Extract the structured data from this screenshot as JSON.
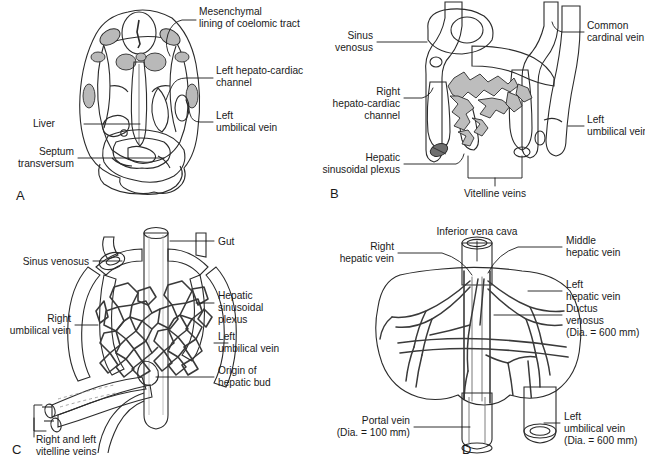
{
  "figure": {
    "panels": [
      {
        "letter": "A",
        "name": "panel-a",
        "labels": [
          {
            "id": "mesenchymal",
            "line1": "Mesenchymal",
            "line2": "lining of coelomic tract"
          },
          {
            "id": "left-hepato-cardiac",
            "line1": "Left hepato-cardiac",
            "line2": "channel"
          },
          {
            "id": "left-umbilical-vein",
            "line1": "Left",
            "line2": "umbilical vein"
          },
          {
            "id": "liver",
            "line1": "Liver",
            "line2": ""
          },
          {
            "id": "septum-transversum",
            "line1": "Septum",
            "line2": "transversum"
          }
        ]
      },
      {
        "letter": "B",
        "name": "panel-b",
        "labels": [
          {
            "id": "sinus-venosus",
            "line1": "Sinus",
            "line2": "venosus"
          },
          {
            "id": "common-cardinal-vein",
            "line1": "Common",
            "line2": "cardinal vein"
          },
          {
            "id": "right-hepato-cardiac",
            "line1": "Right",
            "line2": "hepato-cardiac",
            "line3": "channel"
          },
          {
            "id": "left-umbilical-vein",
            "line1": "Left",
            "line2": "umbilical vein"
          },
          {
            "id": "hepatic-sinusoidal-plexus",
            "line1": "Hepatic",
            "line2": "sinusoidal plexus"
          },
          {
            "id": "vitelline-veins",
            "line1": "Vitelline veins",
            "line2": ""
          }
        ]
      },
      {
        "letter": "C",
        "name": "panel-c",
        "labels": [
          {
            "id": "gut",
            "line1": "Gut",
            "line2": ""
          },
          {
            "id": "sinus-venosus",
            "line1": "Sinus venosus",
            "line2": ""
          },
          {
            "id": "right-umbilical-vein",
            "line1": "Right",
            "line2": "umbilical vein"
          },
          {
            "id": "hepatic-sinusoidal-plexus",
            "line1": "Hepatic",
            "line2": "sinusoidal",
            "line3": "plexus"
          },
          {
            "id": "left-umbilical-vein",
            "line1": "Left",
            "line2": "umbilical vein"
          },
          {
            "id": "origin-of-hepatic-bud",
            "line1": "Origin of",
            "line2": "hepatic bud"
          },
          {
            "id": "right-and-left-vitelline-veins",
            "line1": "Right and left",
            "line2": "vitelline veins"
          }
        ]
      },
      {
        "letter": "D",
        "name": "panel-d",
        "labels": [
          {
            "id": "inferior-vena-cava",
            "line1": "Inferior vena cava",
            "line2": ""
          },
          {
            "id": "right-hepatic-vein",
            "line1": "Right",
            "line2": "hepatic vein"
          },
          {
            "id": "middle-hepatic-vein",
            "line1": "Middle",
            "line2": "hepatic vein"
          },
          {
            "id": "left-hepatic-vein",
            "line1": "Left",
            "line2": "hepatic vein"
          },
          {
            "id": "ductus-venosus",
            "line1": "Ductus",
            "line2": "venosus",
            "line3": "(Dia. = 600 mm)"
          },
          {
            "id": "portal-vein",
            "line1": "Portal vein",
            "line2": "(Dia. = 100 mm)"
          },
          {
            "id": "left-umbilical-vein",
            "line1": "Left",
            "line2": "umbilical vein",
            "line3": "(Dia. = 600 mm)"
          }
        ]
      }
    ]
  },
  "colors": {
    "ink": "#1a1a1a",
    "outline": "#2b2b2b",
    "tissue_light": "#dcdcdc",
    "tissue_mid": "#c2c2c2",
    "vessel_light": "#c9c9c9",
    "vessel_mid": "#a0a0a0",
    "vessel_dark": "#8a8a8a",
    "organ_dark": "#909090",
    "background": "#ffffff"
  },
  "caption": {
    "text": "cut-off caption line"
  }
}
